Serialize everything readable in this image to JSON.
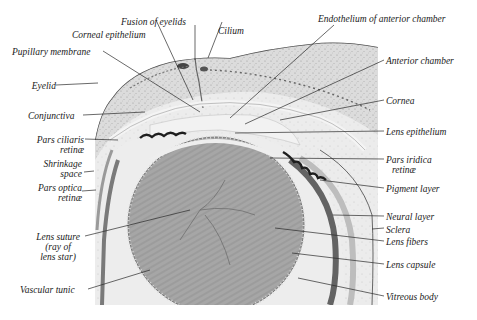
{
  "figure": {
    "colors": {
      "background": "#ffffff",
      "tissue_light": "#e6e6e6",
      "tissue_stroma": "#d2d2d2",
      "lens": "#a9a9a9",
      "vitreous": "#ececec",
      "pigment": "#1e1e1e",
      "leader_line": "#2a2a2a",
      "text": "#1a1a1a"
    }
  },
  "labels": {
    "left": [
      {
        "id": "pupillary-membrane",
        "text": "Pupillary membrane"
      },
      {
        "id": "eyelid",
        "text": "Eyelid"
      },
      {
        "id": "conjunctiva",
        "text": "Conjunctiva"
      },
      {
        "id": "pars-ciliaris-retinae",
        "line1": "Pars ciliaris",
        "line2": "retinæ"
      },
      {
        "id": "shrinkage-space",
        "line1": "Shrinkage",
        "line2": "space"
      },
      {
        "id": "pars-optica-retinae",
        "line1": "Pars optica",
        "line2": "retinæ"
      },
      {
        "id": "lens-suture",
        "line1": "Lens suture",
        "line2": "(ray of",
        "line3": "lens star)"
      },
      {
        "id": "vascular-tunic",
        "text": "Vascular tunic"
      }
    ],
    "top": [
      {
        "id": "fusion-of-eyelids",
        "text": "Fusion of eyelids"
      },
      {
        "id": "corneal-epithelium",
        "text": "Corneal epithelium"
      },
      {
        "id": "cilium",
        "text": "Cilium"
      },
      {
        "id": "endothelium-of-anterior-chamber",
        "text": "Endothelium of anterior chamber"
      }
    ],
    "right": [
      {
        "id": "anterior-chamber",
        "text": "Anterior chamber"
      },
      {
        "id": "cornea",
        "text": "Cornea"
      },
      {
        "id": "lens-epithelium",
        "text": "Lens epithelium"
      },
      {
        "id": "pars-iridica-retinae",
        "line1": "Pars iridica",
        "line2": "retinæ"
      },
      {
        "id": "pigment-layer",
        "text": "Pigment layer"
      },
      {
        "id": "neural-layer",
        "text": "Neural layer"
      },
      {
        "id": "sclera",
        "text": "Sclera"
      },
      {
        "id": "lens-fibers",
        "text": "Lens fibers"
      },
      {
        "id": "lens-capsule",
        "text": "Lens capsule"
      },
      {
        "id": "vitreous-body",
        "text": "Vitreous body"
      }
    ]
  }
}
